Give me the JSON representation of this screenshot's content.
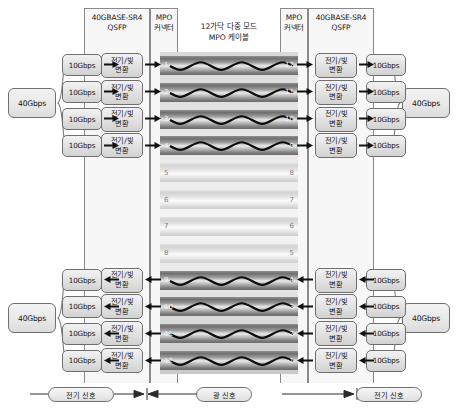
{
  "diagram": {
    "headers": {
      "left_qsfp": "40GBASE-SR4\nQSFP",
      "left_qsfp_line1": "40GBASE-SR4",
      "left_qsfp_line2": "QSFP",
      "left_mpo_line1": "MPO",
      "left_mpo_line2": "커넥터",
      "cable_line1": "12가닥 다중 모드",
      "cable_line2": "MPO 케이블",
      "right_mpo_line1": "MPO",
      "right_mpo_line2": "커넥터",
      "right_qsfp_line1": "40GBASE-SR4",
      "right_qsfp_line2": "QSFP"
    },
    "aggregate": {
      "left_top": "40Gbps",
      "left_bottom": "40Gbps",
      "right_top": "40Gbps",
      "right_bottom": "40Gbps"
    },
    "lane_label": "10Gbps",
    "converter_line1": "전기/빛",
    "converter_line2": "변환",
    "lanes": {
      "top_left": [
        "10Gbps",
        "10Gbps",
        "10Gbps",
        "10Gbps"
      ],
      "bottom_left": [
        "10Gbps",
        "10Gbps",
        "10Gbps",
        "10Gbps"
      ],
      "top_right": [
        "10Gbps",
        "10Gbps",
        "10Gbps",
        "10Gbps"
      ],
      "bottom_right": [
        "10Gbps",
        "10Gbps",
        "10Gbps",
        "10Gbps"
      ]
    },
    "converters": {
      "top_left": [
        "전기/빛 변환",
        "전기/빛 변환",
        "전기/빛 변환",
        "전기/빛 변환"
      ],
      "bottom_left": [
        "전기/빛 변환",
        "전기/빛 변환",
        "전기/빛 변환",
        "전기/빛 변환"
      ],
      "top_right": [
        "전기/빛 변환",
        "전기/빛 변환",
        "전기/빛 변환",
        "전기/빛 변환"
      ],
      "bottom_right": [
        "전기/빛 변환",
        "전기/빛 변환",
        "전기/빛 변환",
        "전기/빛 변환"
      ]
    },
    "fibers": [
      {
        "left": "1",
        "right": "12",
        "state": "active"
      },
      {
        "left": "2",
        "right": "11",
        "state": "active"
      },
      {
        "left": "3",
        "right": "10",
        "state": "active"
      },
      {
        "left": "4",
        "right": "9",
        "state": "active"
      },
      {
        "left": "5",
        "right": "8",
        "state": "idle"
      },
      {
        "left": "6",
        "right": "7",
        "state": "idle"
      },
      {
        "left": "7",
        "right": "6",
        "state": "idle"
      },
      {
        "left": "8",
        "right": "5",
        "state": "idle"
      },
      {
        "left": "9",
        "right": "4",
        "state": "active"
      },
      {
        "left": "10",
        "right": "3",
        "state": "active"
      },
      {
        "left": "11",
        "right": "2",
        "state": "active"
      },
      {
        "left": "12",
        "right": "1",
        "state": "active"
      }
    ],
    "legend": {
      "left_signal": "전기 신호",
      "center_signal": "광 신호",
      "right_signal": "전기 신호"
    },
    "colors": {
      "box_border": "#6f6f6f",
      "band_border": "#8a8a8a",
      "band_fill": "#f7f7f7",
      "arrow": "#111111",
      "active_fiber": "#7a7a7a",
      "idle_fiber": "#e0e0e0",
      "text": "#141414"
    }
  }
}
